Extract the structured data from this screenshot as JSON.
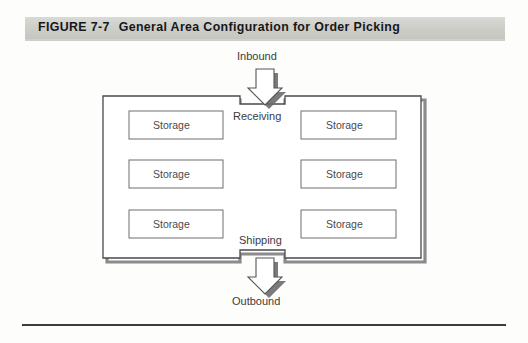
{
  "figure": {
    "number": "FIGURE 7-7",
    "title": "General Area Configuration for Order Picking"
  },
  "diagram": {
    "type": "warehouse-layout",
    "flow_labels": {
      "inbound": "Inbound",
      "outbound": "Outbound"
    },
    "dock_labels": {
      "receiving": "Receiving",
      "shipping": "Shipping"
    },
    "storage_areas": [
      {
        "label": "Storage",
        "column": "left",
        "row": 1
      },
      {
        "label": "Storage",
        "column": "right",
        "row": 1
      },
      {
        "label": "Storage",
        "column": "left",
        "row": 2
      },
      {
        "label": "Storage",
        "column": "right",
        "row": 2
      },
      {
        "label": "Storage",
        "column": "left",
        "row": 3
      },
      {
        "label": "Storage",
        "column": "right",
        "row": 3
      }
    ],
    "arrows": [
      {
        "name": "inbound-arrow",
        "direction": "down",
        "position": "top"
      },
      {
        "name": "outbound-arrow",
        "direction": "down",
        "position": "bottom"
      }
    ],
    "colors": {
      "banner_background": "#cfcfca",
      "banner_text": "#17171a",
      "wall_stroke": "#4a4a4c",
      "box_stroke": "#6e6e70",
      "shadow": "#6b6b6d",
      "label_text": "#3b3b3d",
      "rule": "#3c3c3e"
    }
  }
}
